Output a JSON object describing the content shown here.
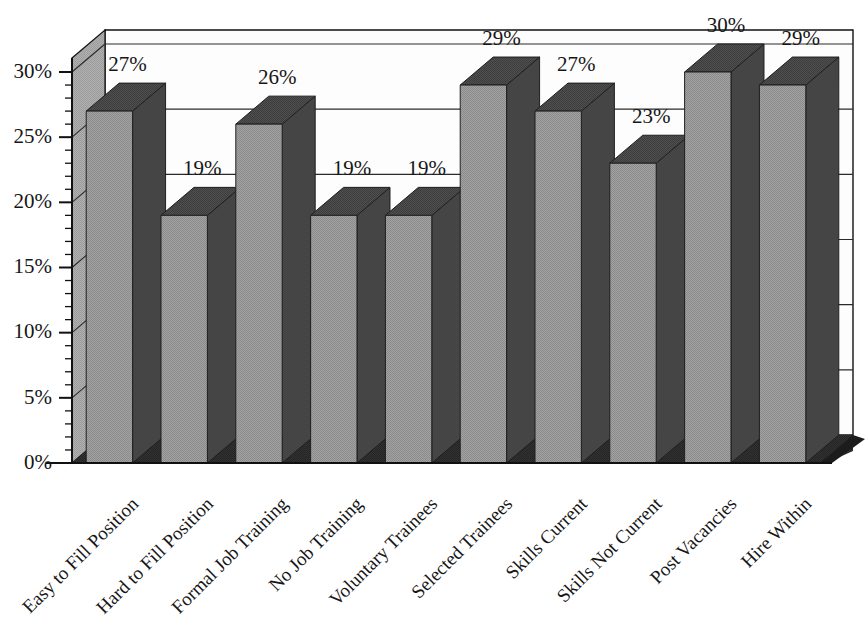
{
  "chart_data": {
    "type": "bar",
    "title": "",
    "subtitle": "",
    "xlabel": "",
    "ylabel": "",
    "ylim": [
      0,
      30
    ],
    "ytick_values": [
      0,
      5,
      10,
      15,
      20,
      25,
      30
    ],
    "ytick_labels": [
      "0%",
      "5%",
      "10%",
      "15%",
      "20%",
      "25%",
      "30%"
    ],
    "minor_tick_interval": 1,
    "grid": true,
    "grid_axis": "y",
    "legend": false,
    "legend_position": "none",
    "style": "3d-column",
    "value_label_suffix": "%",
    "categories": [
      "Easy to Fill Position",
      "Hard to Fill Position",
      "Formal Job Training",
      "No Job Training",
      "Voluntary Trainees",
      "Selected Trainees",
      "Skills Current",
      "Skills Not Current",
      "Post Vacancies",
      "Hire Within"
    ],
    "values": [
      27,
      19,
      26,
      19,
      19,
      29,
      27,
      23,
      30,
      29
    ],
    "value_labels": [
      "27%",
      "19%",
      "26%",
      "19%",
      "19%",
      "29%",
      "27%",
      "23%",
      "30%",
      "29%"
    ],
    "category_label_rotation": -45
  },
  "colors": {
    "background": "#ffffff",
    "plot_area": "#fdfdfd",
    "wall_left": "#a8a8a8",
    "floor": "#2e2e2e",
    "floor_edge": "#1c1c1c",
    "bar_front": "#9a9a9a",
    "bar_top": "#4a4a4a",
    "bar_side": "#454545",
    "gridline": "#2a2a2a",
    "axis_line": "#111111",
    "text": "#161616"
  }
}
